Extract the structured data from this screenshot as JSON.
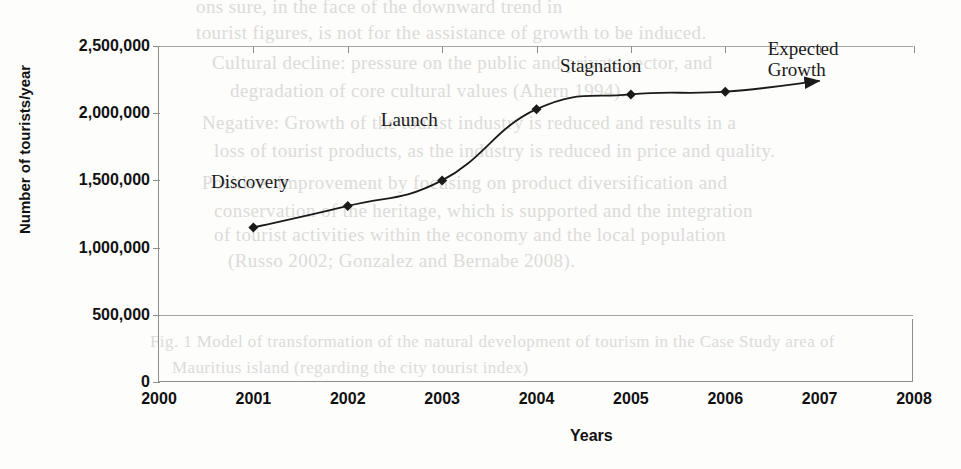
{
  "chart_data": {
    "type": "line",
    "title": "",
    "xlabel": "Years",
    "ylabel": "Number of tourists/year",
    "x": [
      2001,
      2002,
      2003,
      2004,
      2005,
      2006,
      2007
    ],
    "values": [
      1150000,
      1310000,
      1500000,
      2030000,
      2140000,
      2160000,
      2240000
    ],
    "series": [
      {
        "name": "Number of tourists/year",
        "values": [
          1150000,
          1310000,
          1500000,
          2030000,
          2140000,
          2160000,
          2240000
        ]
      }
    ],
    "xlim": [
      2000,
      2008
    ],
    "ylim": [
      0,
      2500000
    ],
    "x_ticks": [
      "2000",
      "2001",
      "2002",
      "2003",
      "2004",
      "2005",
      "2006",
      "2007",
      "2008"
    ],
    "y_ticks": [
      "0",
      "500,000",
      "1,000,000",
      "1,500,000",
      "2,000,000",
      "2,500,000"
    ],
    "y_tick_values": [
      0,
      500000,
      1000000,
      1500000,
      2000000,
      2500000
    ],
    "gridlines": [
      500000,
      2500000
    ],
    "grid": "horizontal-partial",
    "legend": "none",
    "marker": "diamond",
    "line_color": "#1a1a1a",
    "marker_color": "#1a1a1a",
    "end_arrow": true,
    "annotations": [
      {
        "text": "Discovery",
        "x_value": 2000.55,
        "y_value": 1570000
      },
      {
        "text": "Launch",
        "x_value": 2002.35,
        "y_value": 2030000
      },
      {
        "text": "Stagnation",
        "x_value": 2004.25,
        "y_value": 2430000
      },
      {
        "text": "Expected\nGrowth",
        "x_value": 2006.45,
        "y_value": 2560000
      }
    ]
  },
  "bleed_through": {
    "note": "faint ghost text showing through from the reverse side of the scanned page",
    "lines": [
      {
        "text": "ons sure, in the face of the downward trend in",
        "x": 196,
        "y": -4,
        "size": 19
      },
      {
        "text": "tourist figures, is not for the assistance of growth to be induced.",
        "x": 196,
        "y": 22,
        "size": 19
      },
      {
        "text": "Cultural decline: pressure on the public and private sector, and",
        "x": 212,
        "y": 52,
        "size": 19
      },
      {
        "text": "degradation of core cultural values (Ahern 1994).",
        "x": 230,
        "y": 80,
        "size": 19
      },
      {
        "text": "Negative: Growth of the tourist industry is reduced and results in a",
        "x": 202,
        "y": 112,
        "size": 19
      },
      {
        "text": "loss of tourist products, as the industry is reduced in price and quality.",
        "x": 214,
        "y": 140,
        "size": 19
      },
      {
        "text": "Positive: improvement by focusing on product diversification and",
        "x": 202,
        "y": 172,
        "size": 19
      },
      {
        "text": "conservation of the heritage, which is supported and the integration",
        "x": 214,
        "y": 200,
        "size": 19
      },
      {
        "text": "of tourist activities within the economy and the local population",
        "x": 214,
        "y": 224,
        "size": 19
      },
      {
        "text": "(Russo 2002; Gonzalez and Bernabe 2008).",
        "x": 228,
        "y": 250,
        "size": 19
      },
      {
        "text": "Fig. 1 Model of transformation of the natural development of tourism in the Case Study area of",
        "x": 150,
        "y": 332,
        "size": 17
      },
      {
        "text": "Mauritius island (regarding the city tourist index)",
        "x": 172,
        "y": 358,
        "size": 17
      }
    ]
  }
}
